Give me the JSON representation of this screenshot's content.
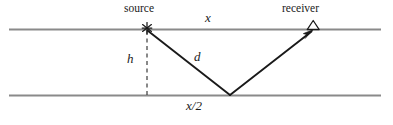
{
  "figure": {
    "width": 393,
    "height": 125,
    "background_color": "#ffffff"
  },
  "labels": {
    "source": "source",
    "receiver": "receiver",
    "offset": "x",
    "raypath": "d",
    "depth": "h",
    "half_offset": "x/2"
  },
  "markers": {
    "source_symbol": "asterisk",
    "receiver_symbol": "triangle"
  },
  "colors": {
    "layer_line": "#8a8a8a",
    "ray_line": "#1a1a1a",
    "dashed_line": "#3a3a3a",
    "text": "#1a1a1a"
  },
  "geometry": {
    "top_interface": {
      "x1": 9,
      "y1": 29.5,
      "x2": 381,
      "y2": 29.5
    },
    "bottom_interface": {
      "x1": 9,
      "y1": 95.5,
      "x2": 381,
      "y2": 95.5
    },
    "source_point": {
      "x": 147,
      "y": 30
    },
    "receiver_point": {
      "x": 313,
      "y": 30
    },
    "reflection_point": {
      "x": 230,
      "y": 95
    },
    "depth_line": {
      "x": 147,
      "y1": 31,
      "y2": 95
    }
  }
}
